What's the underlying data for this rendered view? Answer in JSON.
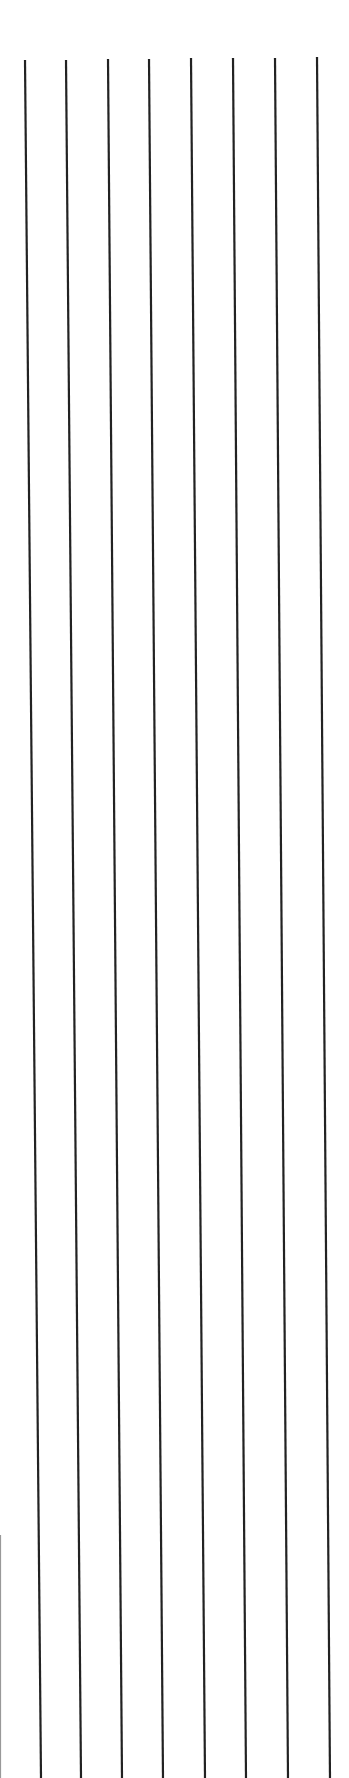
{
  "canvas": {
    "width": 349,
    "height": 1778,
    "background": "#ffffff"
  },
  "lines": {
    "color": "#222222",
    "stroke_width": 2.2,
    "items": [
      {
        "x1": 25,
        "y1": 60,
        "x2": 41,
        "y2": 1778
      },
      {
        "x1": 66,
        "y1": 60,
        "x2": 81,
        "y2": 1778
      },
      {
        "x1": 108,
        "y1": 59,
        "x2": 122,
        "y2": 1778
      },
      {
        "x1": 149,
        "y1": 59,
        "x2": 163,
        "y2": 1778
      },
      {
        "x1": 191,
        "y1": 58,
        "x2": 205,
        "y2": 1778
      },
      {
        "x1": 233,
        "y1": 58,
        "x2": 246,
        "y2": 1778
      },
      {
        "x1": 275,
        "y1": 58,
        "x2": 288,
        "y2": 1778
      },
      {
        "x1": 317,
        "y1": 57,
        "x2": 330,
        "y2": 1778
      }
    ],
    "edge_line": {
      "x1": 0.5,
      "y1": 1535,
      "x2": 0.5,
      "y2": 1778,
      "color": "#999999",
      "stroke_width": 1.2
    }
  }
}
